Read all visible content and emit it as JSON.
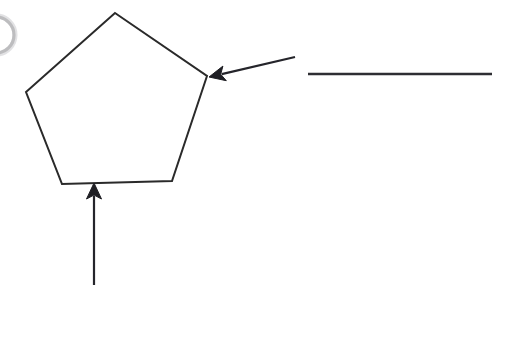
{
  "page": {
    "background_color": "#ffffff",
    "width": 507,
    "height": 337,
    "ink_color": "#2a2a2a",
    "faint_ink_color": "#b6b6b8"
  },
  "chart_data": {
    "type": "diagram",
    "title": "",
    "grid": false,
    "legend": false,
    "shapes": [
      {
        "name": "pentagon",
        "kind": "polygon",
        "sides": 5,
        "filled": false,
        "stroke": "#2a2a2a",
        "stroke_width": 2,
        "points": [
          [
            115,
            13
          ],
          [
            207,
            76
          ],
          [
            172,
            181
          ],
          [
            62,
            184
          ],
          [
            26,
            92
          ]
        ]
      },
      {
        "name": "faint-circle-arc",
        "kind": "arc",
        "filled": false,
        "stroke": "#b6b6b8",
        "stroke_width": 3,
        "center": [
          -4,
          35
        ],
        "radius": 18,
        "note": "partial circle cropped by left edge of page"
      }
    ],
    "annotations": [
      {
        "name": "leader-arrow-vertex",
        "kind": "arrow",
        "from": [
          295,
          57
        ],
        "to": [
          209,
          77
        ],
        "head_at": "to",
        "points_to": "pentagon-upper-right-vertex",
        "label": ""
      },
      {
        "name": "leader-arrow-base",
        "kind": "arrow",
        "from": [
          94,
          285
        ],
        "to": [
          94,
          183
        ],
        "head_at": "to",
        "points_to": "pentagon-bottom-edge",
        "label": ""
      },
      {
        "name": "answer-line",
        "kind": "rule",
        "from": [
          308,
          74
        ],
        "to": [
          492,
          74
        ],
        "label": "",
        "note": "blank horizontal writing line for the answer"
      }
    ]
  },
  "elements": {
    "pentagon_name": "pentagon-outline",
    "vertex_arrow_name": "vertex-leader-arrow",
    "base_arrow_name": "base-leader-arrow",
    "answer_line_name": "blank-answer-line",
    "ghost_arc_name": "cropped-circle-arc",
    "answer_line_value": "",
    "vertex_label_value": "",
    "base_label_value": ""
  }
}
